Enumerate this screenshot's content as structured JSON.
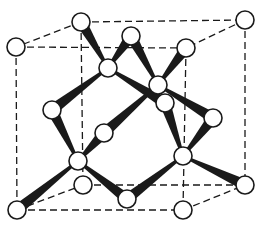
{
  "diagram": {
    "title": "",
    "type": "crystal-lattice",
    "colors": {
      "line": "#1a1a1a",
      "atom_fill": "#ffffff",
      "background": "#ffffff"
    },
    "atom_radius": 9,
    "atoms": [
      {
        "id": "a0",
        "x": 81,
        "y": 22
      },
      {
        "id": "a1",
        "x": 245,
        "y": 20
      },
      {
        "id": "a2",
        "x": 16,
        "y": 47
      },
      {
        "id": "a3",
        "x": 186,
        "y": 48
      },
      {
        "id": "a4",
        "x": 131,
        "y": 36
      },
      {
        "id": "a5",
        "x": 108,
        "y": 68
      },
      {
        "id": "a6",
        "x": 158,
        "y": 85
      },
      {
        "id": "a7",
        "x": 165,
        "y": 103
      },
      {
        "id": "a8",
        "x": 52,
        "y": 110
      },
      {
        "id": "a9",
        "x": 213,
        "y": 118
      },
      {
        "id": "a10",
        "x": 104,
        "y": 133
      },
      {
        "id": "a11",
        "x": 78,
        "y": 161
      },
      {
        "id": "a12",
        "x": 183,
        "y": 156
      },
      {
        "id": "a13",
        "x": 83,
        "y": 185
      },
      {
        "id": "a14",
        "x": 245,
        "y": 185
      },
      {
        "id": "a15",
        "x": 17,
        "y": 210
      },
      {
        "id": "a16",
        "x": 183,
        "y": 210
      },
      {
        "id": "a17",
        "x": 127,
        "y": 199
      }
    ],
    "dashed_edges": [
      [
        "a0",
        "a1"
      ],
      [
        "a2",
        "a3"
      ],
      [
        "a0",
        "a2"
      ],
      [
        "a1",
        "a3"
      ],
      [
        "a2",
        "a15"
      ],
      [
        "a3",
        "a16"
      ],
      [
        "a1",
        "a14"
      ],
      [
        "a0",
        "a13"
      ],
      [
        "a15",
        "a16"
      ],
      [
        "a13",
        "a14"
      ],
      [
        "a15",
        "a13"
      ],
      [
        "a16",
        "a14"
      ]
    ],
    "bonds": [
      [
        "a5",
        "a0"
      ],
      [
        "a5",
        "a4"
      ],
      [
        "a5",
        "a8"
      ],
      [
        "a5",
        "a7"
      ],
      [
        "a6",
        "a4"
      ],
      [
        "a6",
        "a3"
      ],
      [
        "a6",
        "a9"
      ],
      [
        "a6",
        "a10"
      ],
      [
        "a11",
        "a8"
      ],
      [
        "a11",
        "a10"
      ],
      [
        "a11",
        "a15"
      ],
      [
        "a11",
        "a17"
      ],
      [
        "a12",
        "a7"
      ],
      [
        "a12",
        "a9"
      ],
      [
        "a12",
        "a17"
      ],
      [
        "a12",
        "a14"
      ]
    ]
  }
}
